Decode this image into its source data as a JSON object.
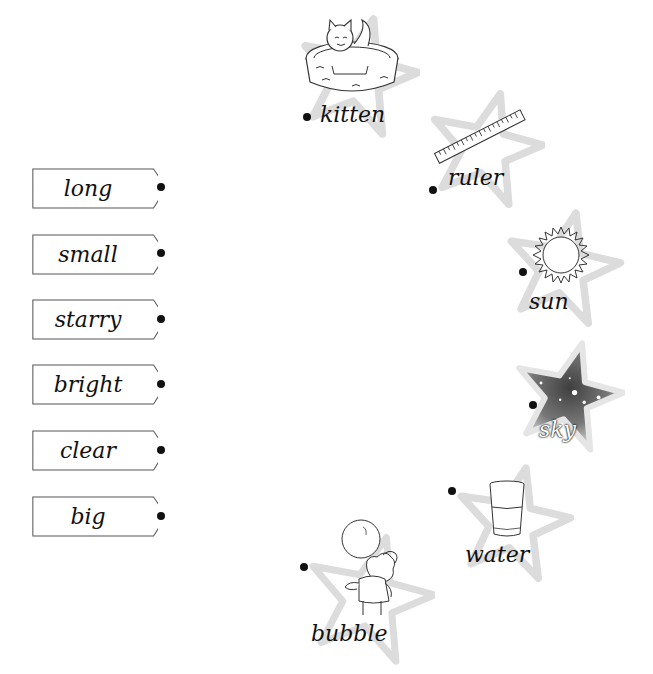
{
  "adjectives": [
    {
      "word": "long"
    },
    {
      "word": "small"
    },
    {
      "word": "starry"
    },
    {
      "word": "bright"
    },
    {
      "word": "clear"
    },
    {
      "word": "big"
    }
  ],
  "nouns": [
    {
      "word": "kitten",
      "icon": "kitten-in-basket-icon"
    },
    {
      "word": "ruler",
      "icon": "ruler-icon"
    },
    {
      "word": "sun",
      "icon": "sun-icon"
    },
    {
      "word": "sky",
      "icon": "starry-sky-icon"
    },
    {
      "word": "water",
      "icon": "glass-of-water-icon"
    },
    {
      "word": "bubble",
      "icon": "boy-blowing-bubble-icon"
    }
  ],
  "colors": {
    "star_outline": "#d9d9d9",
    "sky_dark": "#555555",
    "text": "#111111"
  }
}
